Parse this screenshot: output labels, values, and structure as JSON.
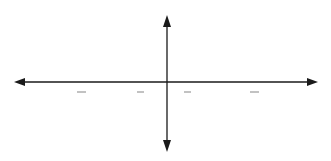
{
  "chart_data": {
    "type": "line",
    "title": "",
    "function": "y = 2cos(x)",
    "xlabel": "x",
    "ylabel": "y",
    "xlim": [
      -6.2832,
      6.2832
    ],
    "ylim": [
      -2,
      2
    ],
    "grid": true,
    "legend": null,
    "x_tick_labels": [
      "-2π",
      "-3π/2",
      "-π",
      "-π/2",
      "0",
      "π/2",
      "π",
      "3π/2",
      "2π"
    ],
    "y_tick_labels": [
      "2",
      "1",
      "-1",
      "-2"
    ],
    "series": [
      {
        "name": "curve",
        "x": [
          -6.2832,
          -4.7124,
          -3.1416,
          -1.5708,
          0,
          1.5708,
          3.1416,
          4.7124,
          6.2832
        ],
        "values": [
          2,
          0,
          -2,
          0,
          2,
          0,
          -2,
          0,
          2
        ]
      }
    ]
  },
  "labels": {
    "x_axis": "x",
    "y_axis": "y",
    "origin": "0",
    "neg_two_pi": "−2π",
    "neg_three_half_pi_num": "3π",
    "neg_three_half_pi_den": "2",
    "neg_three_half_pi_sign": "−",
    "neg_pi": "−π",
    "neg_half_pi_num": "π",
    "neg_half_pi_den": "2",
    "neg_half_pi_sign": "−",
    "half_pi_num": "π",
    "half_pi_den": "2",
    "pi": "π",
    "three_half_pi_num": "3π",
    "three_half_pi_den": "2",
    "two_pi": "2π",
    "y_two": "2",
    "y_one": "1",
    "y_neg_one": "−1",
    "y_neg_two": "−2"
  },
  "colors": {
    "grid": "#c8c8c8",
    "axis": "#1a1a1a",
    "curve": "#2a2a2a"
  }
}
